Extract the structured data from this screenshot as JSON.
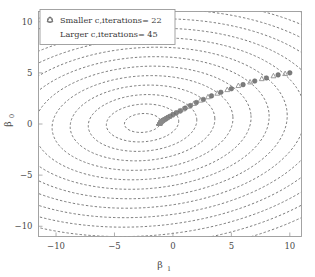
{
  "chart_data": {
    "type": "line",
    "title": "",
    "xlabel": "β₁",
    "ylabel": "β₀",
    "xlim": [
      -11.5,
      11.0
    ],
    "ylim": [
      -11.0,
      11.0
    ],
    "xticks": [
      -10,
      -5,
      0,
      5,
      10
    ],
    "xtick_labels": [
      "−10",
      "−5",
      "0",
      "5",
      "10"
    ],
    "yticks": [
      -10,
      -5,
      0,
      5,
      10
    ],
    "ytick_labels": [
      "−10",
      "−5",
      "0",
      "5",
      "10"
    ],
    "grid": false,
    "legend_position": "upper-left",
    "background_contours": {
      "description": "dashed elliptical cost contours",
      "center": [
        -2.6,
        0.1
      ],
      "levels": 14,
      "rx_step": 1.55,
      "ry_step": 0.92,
      "rotation_deg": -4,
      "color": "#555555",
      "dash": "2.4 2.0"
    },
    "series": [
      {
        "name": "Smaller c,iterations= 22",
        "marker": "circle",
        "color": "#7c7c7c",
        "x": [
          10.0,
          9.0,
          8.0,
          7.0,
          6.0,
          5.0,
          4.1,
          3.3,
          2.6,
          2.0,
          1.5,
          1.05,
          0.65,
          0.3,
          0.0,
          -0.25,
          -0.45,
          -0.6,
          -0.72,
          -0.82,
          -0.9,
          -0.96
        ],
        "y": [
          5.0,
          4.8,
          4.5,
          4.2,
          3.85,
          3.45,
          3.1,
          2.75,
          2.4,
          2.1,
          1.8,
          1.55,
          1.3,
          1.1,
          0.92,
          0.76,
          0.63,
          0.52,
          0.44,
          0.37,
          0.31,
          0.26
        ]
      },
      {
        "name": "Larger c,iterations= 45",
        "marker": "triangle",
        "color": "#8a8a8a",
        "x": [
          9.6,
          8.6,
          7.6,
          6.6,
          5.6,
          4.65,
          3.8,
          3.0,
          2.35,
          1.8,
          1.3,
          0.88,
          0.5,
          0.18,
          -0.1,
          -0.33,
          -0.52,
          -0.67,
          -0.79,
          -0.88,
          -0.95,
          -1.0,
          -1.04,
          -1.07,
          -1.09,
          -1.11,
          -1.12,
          -1.13,
          -1.14,
          -1.145,
          -1.15,
          -1.152,
          -1.154,
          -1.156,
          -1.158,
          -1.159,
          -1.16,
          -1.161,
          -1.162,
          -1.162,
          -1.163,
          -1.163,
          -1.164,
          -1.164,
          -1.164
        ],
        "y": [
          4.92,
          4.7,
          4.42,
          4.1,
          3.75,
          3.35,
          3.0,
          2.65,
          2.32,
          2.0,
          1.72,
          1.46,
          1.24,
          1.04,
          0.87,
          0.72,
          0.6,
          0.5,
          0.42,
          0.35,
          0.3,
          0.26,
          0.22,
          0.19,
          0.17,
          0.15,
          0.135,
          0.12,
          0.11,
          0.1,
          0.095,
          0.09,
          0.085,
          0.08,
          0.078,
          0.076,
          0.074,
          0.072,
          0.07,
          0.069,
          0.068,
          0.067,
          0.066,
          0.065,
          0.065
        ]
      }
    ]
  },
  "legend": {
    "entries": [
      {
        "marker": "circle-marker",
        "label": "Smaller c,iterations= 22"
      },
      {
        "marker": "triangle-marker",
        "label": "Larger c,iterations= 45"
      }
    ]
  },
  "axes": {
    "x_title": "β",
    "x_sub": "1",
    "y_title": "β",
    "y_sub": "0"
  },
  "colors": {
    "frame": "#9a9a9a",
    "contour": "#555555",
    "marker_circle": "#7c7c7c",
    "marker_triangle": "#8a8a8a",
    "text": "#4a4a4a"
  }
}
